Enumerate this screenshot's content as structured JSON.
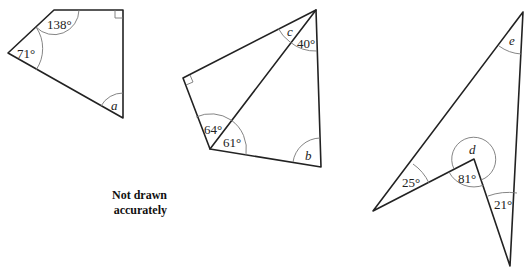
{
  "diagram": {
    "note": {
      "line1": "Not drawn",
      "line2": "accurately"
    },
    "shapes": [
      {
        "name": "quadrilateral-1",
        "vertices": [
          [
            54,
            10
          ],
          [
            123,
            10
          ],
          [
            123,
            118
          ],
          [
            8,
            53
          ]
        ],
        "angles": {
          "top_left": "138°",
          "left": "71°",
          "bottom": "a",
          "top_right": "right-angle"
        }
      },
      {
        "name": "quadrilateral-2",
        "vertices": [
          [
            316,
            10
          ],
          [
            321,
            167
          ],
          [
            210,
            149
          ],
          [
            183,
            78
          ]
        ],
        "diagonal": [
          [
            210,
            149
          ],
          [
            316,
            10
          ]
        ],
        "angles": {
          "top_c": "c",
          "top_40": "40°",
          "bottom_left_upper": "64°",
          "bottom_left_lower": "61°",
          "bottom_right": "b",
          "left": "right-angle"
        }
      },
      {
        "name": "arrowhead-quadrilateral",
        "vertices": [
          [
            523,
            12
          ],
          [
            510,
            266
          ],
          [
            474,
            159
          ],
          [
            373,
            211
          ]
        ],
        "angles": {
          "top": "e",
          "left": "25°",
          "reflex": "d",
          "inner": "81°",
          "right": "21°"
        }
      }
    ],
    "labels": {
      "a": "a",
      "b": "b",
      "c": "c",
      "d": "d",
      "e": "e",
      "deg138": "138°",
      "deg71": "71°",
      "deg40": "40°",
      "deg64": "64°",
      "deg61": "61°",
      "deg25": "25°",
      "deg81": "81°",
      "deg21": "21°"
    }
  }
}
